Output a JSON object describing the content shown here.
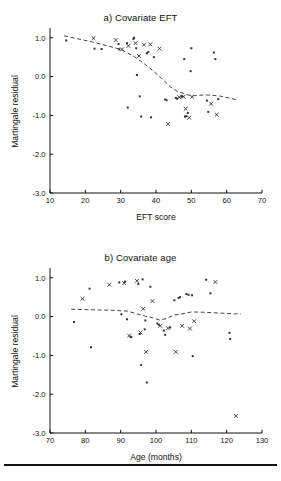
{
  "figure": {
    "background": "#ffffff",
    "ink": "#111111",
    "marker_color": "#333333",
    "line_color": "#444444",
    "has_bottom_rule": true
  },
  "chart_data": [
    {
      "type": "scatter",
      "id": "panel-a",
      "title": "a) Covariate EFT",
      "xlabel": "EFT score",
      "ylabel": "Martingale residual",
      "xlim": [
        10,
        70
      ],
      "ylim": [
        -3.0,
        1.2
      ],
      "xticks": [
        10,
        20,
        30,
        40,
        50,
        60,
        70
      ],
      "xticklabels": [
        "10",
        "20",
        "30",
        "40",
        "50",
        "60",
        "70"
      ],
      "yticks": [
        1.0,
        0.0,
        -1.0,
        -2.0,
        -3.0
      ],
      "yticklabels": [
        "1.0",
        "0.0",
        "-1.0",
        "-2.0",
        "-3.0"
      ],
      "grid": false,
      "legend": "none",
      "points": [
        [
          14.6,
          0.93
        ],
        [
          22.3,
          0.99
        ],
        [
          22.6,
          0.72
        ],
        [
          24.6,
          0.71
        ],
        [
          28.6,
          0.94
        ],
        [
          29.4,
          0.84
        ],
        [
          29.6,
          0.7
        ],
        [
          30.4,
          0.7
        ],
        [
          31.8,
          0.86
        ],
        [
          32.0,
          -0.8
        ],
        [
          32.2,
          0.79
        ],
        [
          33.6,
          0.97
        ],
        [
          33.8,
          1.0
        ],
        [
          34.2,
          0.86
        ],
        [
          34.4,
          0.73
        ],
        [
          34.6,
          0.04
        ],
        [
          35.2,
          0.53
        ],
        [
          35.4,
          -0.51
        ],
        [
          35.8,
          -1.03
        ],
        [
          36.6,
          0.82
        ],
        [
          37.4,
          0.6
        ],
        [
          37.8,
          0.63
        ],
        [
          38.4,
          0.83
        ],
        [
          38.6,
          -1.05
        ],
        [
          39.4,
          0.5
        ],
        [
          41.0,
          0.72
        ],
        [
          42.6,
          -0.59
        ],
        [
          43.0,
          -0.61
        ],
        [
          43.4,
          -1.22
        ],
        [
          45.6,
          -0.55
        ],
        [
          46.0,
          -0.57
        ],
        [
          46.6,
          -0.53
        ],
        [
          47.2,
          -0.52
        ],
        [
          47.4,
          -0.5
        ],
        [
          47.8,
          -0.52
        ],
        [
          48.0,
          0.45
        ],
        [
          48.2,
          -1.03
        ],
        [
          48.4,
          -0.83
        ],
        [
          48.6,
          -1.02
        ],
        [
          49.0,
          -0.94
        ],
        [
          49.4,
          -1.06
        ],
        [
          49.8,
          0.14
        ],
        [
          50.0,
          0.73
        ],
        [
          50.2,
          -0.52
        ],
        [
          54.4,
          -0.62
        ],
        [
          54.8,
          -0.91
        ],
        [
          55.6,
          -0.7
        ],
        [
          56.4,
          0.62
        ],
        [
          56.8,
          0.45
        ],
        [
          57.2,
          -0.98
        ],
        [
          57.6,
          -0.58
        ]
      ],
      "smoother": {
        "style": "dashed",
        "x": [
          14,
          18,
          22,
          26,
          30,
          33,
          36,
          39,
          42,
          44,
          46,
          48,
          50,
          54,
          58,
          63
        ],
        "y": [
          1.05,
          0.97,
          0.89,
          0.8,
          0.7,
          0.56,
          0.38,
          0.16,
          -0.08,
          -0.26,
          -0.38,
          -0.44,
          -0.5,
          -0.47,
          -0.5,
          -0.6
        ]
      }
    },
    {
      "type": "scatter",
      "id": "panel-b",
      "title": "b) Covariate age",
      "xlabel": "Age (months)",
      "ylabel": "Martingale residual",
      "xlim": [
        70,
        130
      ],
      "ylim": [
        -3.0,
        1.2
      ],
      "xticks": [
        70,
        80,
        90,
        100,
        110,
        120,
        130
      ],
      "xticklabels": [
        "70",
        "80",
        "90",
        "100",
        "110",
        "120",
        "130"
      ],
      "yticks": [
        1.0,
        0.0,
        -1.0,
        -2.0,
        -3.0
      ],
      "yticklabels": [
        "1.0",
        "0.0",
        "-1.0",
        "-2.0",
        "-3.0"
      ],
      "grid": false,
      "legend": "none",
      "points": [
        [
          76.8,
          -0.14
        ],
        [
          79.2,
          0.46
        ],
        [
          81.2,
          0.72
        ],
        [
          81.6,
          -0.79
        ],
        [
          86.8,
          0.82
        ],
        [
          89.6,
          0.88
        ],
        [
          90.2,
          0.06
        ],
        [
          91.0,
          0.86
        ],
        [
          91.2,
          0.9
        ],
        [
          91.8,
          -0.07
        ],
        [
          92.4,
          -0.49
        ],
        [
          92.8,
          -0.52
        ],
        [
          93.0,
          -0.53
        ],
        [
          94.6,
          0.92
        ],
        [
          95.0,
          0.84
        ],
        [
          95.4,
          -0.45
        ],
        [
          95.6,
          -0.41
        ],
        [
          95.8,
          -1.25
        ],
        [
          96.2,
          0.96
        ],
        [
          96.4,
          0.2
        ],
        [
          96.8,
          -0.33
        ],
        [
          97.0,
          -0.1
        ],
        [
          97.2,
          -0.91
        ],
        [
          97.4,
          -1.7
        ],
        [
          98.4,
          0.77
        ],
        [
          99.0,
          0.4
        ],
        [
          100.4,
          -0.18
        ],
        [
          100.8,
          -0.21
        ],
        [
          101.2,
          -0.24
        ],
        [
          102.2,
          -0.36
        ],
        [
          102.6,
          -0.47
        ],
        [
          103.4,
          -0.3
        ],
        [
          104.0,
          -0.28
        ],
        [
          105.2,
          0.42
        ],
        [
          105.6,
          -0.91
        ],
        [
          106.4,
          0.48
        ],
        [
          106.8,
          0.5
        ],
        [
          107.4,
          -0.24
        ],
        [
          108.6,
          0.58
        ],
        [
          109.2,
          0.56
        ],
        [
          109.6,
          -0.31
        ],
        [
          110.2,
          0.55
        ],
        [
          110.4,
          -1.02
        ],
        [
          110.8,
          -0.12
        ],
        [
          114.2,
          0.95
        ],
        [
          115.4,
          0.6
        ],
        [
          116.8,
          0.89
        ],
        [
          120.8,
          -0.42
        ],
        [
          121.0,
          -0.58
        ],
        [
          122.6,
          -2.56
        ]
      ],
      "smoother": {
        "style": "dashed",
        "x": [
          76,
          80,
          84,
          88,
          92,
          95,
          97,
          99,
          101,
          103,
          105,
          107,
          110,
          114,
          118,
          122,
          124
        ],
        "y": [
          0.19,
          0.18,
          0.17,
          0.16,
          0.14,
          0.06,
          0.01,
          -0.03,
          -0.09,
          -0.05,
          0.04,
          0.06,
          0.12,
          0.11,
          0.09,
          0.07,
          0.07
        ]
      }
    }
  ]
}
